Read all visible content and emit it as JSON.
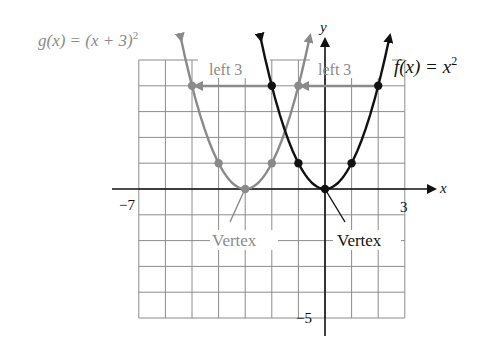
{
  "figure": {
    "type": "function-graph",
    "colors": {
      "grid": "#8c8c8c",
      "axis": "#111111",
      "f_curve": "#111111",
      "g_curve": "#8a8a8a",
      "g_text": "#8a8a8a",
      "text": "#111111"
    }
  },
  "axes": {
    "x_label": "x",
    "y_label": "y",
    "x_min": -7,
    "x_max": 3,
    "y_min": -5,
    "y_max": 5,
    "tick_labels": {
      "x_min_label": "−7",
      "x_max_label": "3",
      "y_min_label": "−5"
    }
  },
  "functions": {
    "f": {
      "label_prefix": "f(x) = x",
      "label_exp": "2",
      "expression": "x^2",
      "vertex": [
        0,
        0
      ],
      "points": [
        [
          -2,
          4
        ],
        [
          -1,
          1
        ],
        [
          0,
          0
        ],
        [
          1,
          1
        ],
        [
          2,
          4
        ]
      ]
    },
    "g": {
      "label_prefix": "g(x) = (x + 3)",
      "label_exp": "2",
      "expression": "(x+3)^2",
      "vertex": [
        -3,
        0
      ],
      "points": [
        [
          -5,
          4
        ],
        [
          -4,
          1
        ],
        [
          -3,
          0
        ],
        [
          -2,
          1
        ],
        [
          -1,
          4
        ]
      ]
    }
  },
  "annotations": {
    "shift_left_1": "left 3",
    "shift_right_1": "left 3",
    "vertex_g": "Vertex",
    "vertex_f": "Vertex"
  }
}
